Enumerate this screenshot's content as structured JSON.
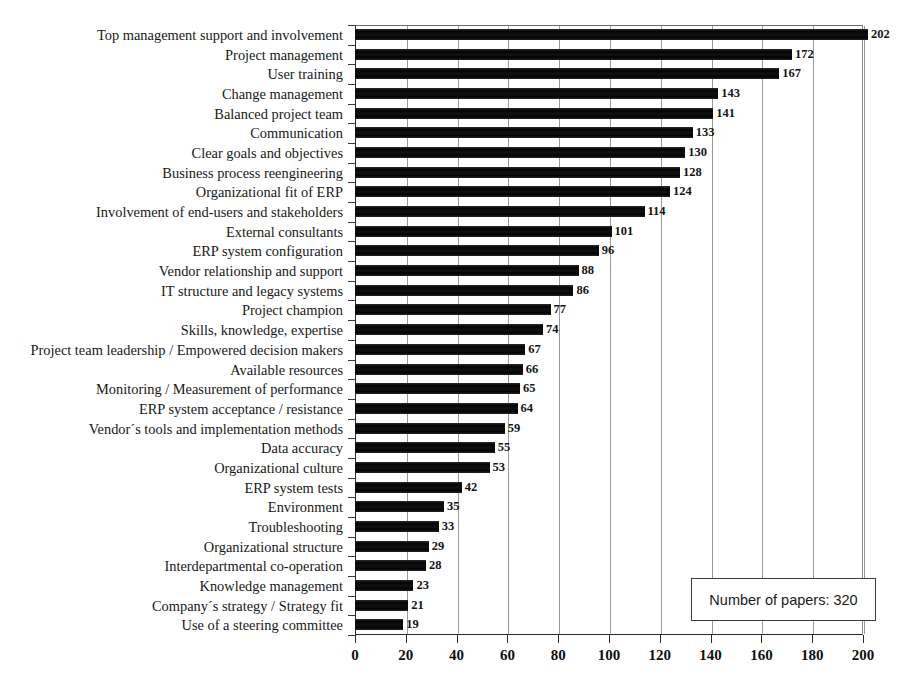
{
  "chart_data": {
    "type": "bar",
    "orientation": "horizontal",
    "title": "",
    "xlabel": "",
    "ylabel": "",
    "xlim": [
      0,
      200
    ],
    "xticks": [
      0,
      20,
      40,
      60,
      80,
      100,
      120,
      140,
      160,
      180,
      200
    ],
    "xtick_labels": [
      "0",
      "20",
      "40",
      "60",
      "80",
      "100",
      "120",
      "140",
      "160",
      "180",
      "200"
    ],
    "grid": "vertical",
    "legend_position": "bottom-right",
    "bar_color": "#0d0d0d",
    "categories": [
      "Top management support and involvement",
      "Project management",
      "User training",
      "Change management",
      "Balanced project team",
      "Communication",
      "Clear goals and objectives",
      "Business process reengineering",
      "Organizational fit of ERP",
      "Involvement of end-users and stakeholders",
      "External consultants",
      "ERP system configuration",
      "Vendor relationship and support",
      "IT structure and legacy systems",
      "Project champion",
      "Skills, knowledge, expertise",
      "Project team leadership / Empowered decision makers",
      "Available resources",
      "Monitoring / Measurement of performance",
      "ERP system acceptance / resistance",
      "Vendor´s tools and implementation methods",
      "Data accuracy",
      "Organizational culture",
      "ERP system tests",
      "Environment",
      "Troubleshooting",
      "Organizational structure",
      "Interdepartmental co-operation",
      "Knowledge management",
      "Company´s strategy / Strategy fit",
      "Use of a steering committee"
    ],
    "values": [
      202,
      172,
      167,
      143,
      141,
      133,
      130,
      128,
      124,
      114,
      101,
      96,
      88,
      86,
      77,
      74,
      67,
      66,
      65,
      64,
      59,
      55,
      53,
      42,
      35,
      33,
      29,
      28,
      23,
      21,
      19
    ],
    "data_labels": [
      "202",
      "172",
      "167",
      "143",
      "141",
      "133",
      "130",
      "128",
      "124",
      "114",
      "101",
      "96",
      "88",
      "86",
      "77",
      "74",
      "67",
      "66",
      "65",
      "64",
      "59",
      "55",
      "53",
      "42",
      "35",
      "33",
      "29",
      "28",
      "23",
      "21",
      "19"
    ],
    "annotations": [
      "Number of papers: 320"
    ]
  },
  "legend": {
    "text": "Number of papers: 320"
  }
}
